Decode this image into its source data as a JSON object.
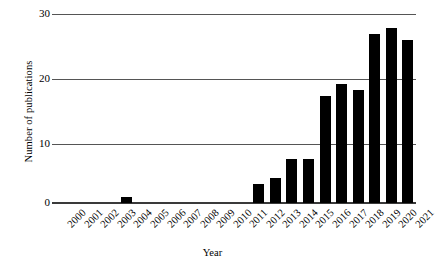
{
  "chart_data": {
    "type": "bar",
    "title": "",
    "xlabel": "Year",
    "ylabel": "Number of publications",
    "categories": [
      "2000",
      "2001",
      "2002",
      "2003",
      "2004",
      "2005",
      "2006",
      "2007",
      "2008",
      "2009",
      "2010",
      "2011",
      "2012",
      "2013",
      "2014",
      "2015",
      "2016",
      "2017",
      "2018",
      "2019",
      "2020",
      "2021"
    ],
    "values": [
      0,
      0,
      0,
      0,
      1,
      0,
      0,
      0,
      0,
      0,
      0,
      0,
      3,
      4,
      7,
      7,
      17,
      19,
      18,
      27,
      28,
      26
    ],
    "ylim": [
      0,
      30
    ],
    "yticks": [
      0,
      10,
      20,
      30
    ],
    "ytick_labels": [
      "0",
      "10",
      "20",
      "30"
    ],
    "grid": "horizontal",
    "legend": "none",
    "bar_color": "#000000",
    "gridline_color": "#555555",
    "background_color": "#ffffff"
  }
}
